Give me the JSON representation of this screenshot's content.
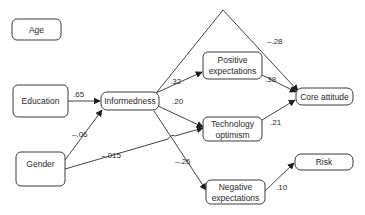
{
  "diagram": {
    "type": "path-model",
    "nodes": {
      "age": {
        "label": "Age"
      },
      "education": {
        "label": "Education"
      },
      "gender": {
        "label": "Gender"
      },
      "informedness": {
        "label": "Informedness"
      },
      "positive_expectations": {
        "line1": "Positive",
        "line2": "expectations"
      },
      "technology_optimism": {
        "line1": "Technology",
        "line2": "optimism"
      },
      "negative_expectations": {
        "line1": "Negative",
        "line2": "expectations"
      },
      "core_attitude": {
        "label": "Core attitude"
      },
      "risk": {
        "label": "Risk"
      }
    },
    "edges": {
      "education_informedness": {
        "from": "Education",
        "to": "Informedness",
        "coefficient": ".65"
      },
      "gender_informedness": {
        "from": "Gender",
        "to": "Informedness",
        "coefficient": "–.06"
      },
      "gender_technology_optimism": {
        "from": "Gender",
        "to": "Technology optimism",
        "coefficient": "–.015"
      },
      "informedness_positive_expectations": {
        "from": "Informedness",
        "to": "Positive expectations",
        "coefficient": ".32"
      },
      "informedness_technology_optimism": {
        "from": "Informedness",
        "to": "Technology optimism",
        "coefficient": ".20"
      },
      "informedness_negative_expectations": {
        "from": "Informedness",
        "to": "Negative expectations",
        "coefficient": "–.26"
      },
      "informedness_core_attitude": {
        "from": "Informedness",
        "to": "Core attitude",
        "coefficient": "–.28"
      },
      "positive_expectations_core_attitude": {
        "from": "Positive expectations",
        "to": "Core attitude",
        "coefficient": ".38"
      },
      "technology_optimism_core_attitude": {
        "from": "Technology optimism",
        "to": "Core attitude",
        "coefficient": ".21"
      },
      "negative_expectations_risk": {
        "from": "Negative expectations",
        "to": "Risk",
        "coefficient": ".10"
      }
    }
  }
}
